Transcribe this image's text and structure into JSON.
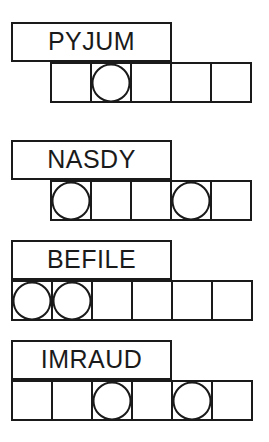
{
  "puzzle": {
    "type": "word-grid-puzzle",
    "background_color": "#ffffff",
    "line_color": "#1a1a1a",
    "groups": [
      {
        "id": "group-1",
        "word": "PYJUM",
        "label_box": {
          "x": 11,
          "y": 22,
          "width": 161,
          "height": 40
        },
        "grid": {
          "x": 50,
          "y": 62,
          "cell_width": 42,
          "cell_height": 41,
          "cells": 5
        },
        "circle_cells": [
          2
        ]
      },
      {
        "id": "group-2",
        "word": "NASDY",
        "label_box": {
          "x": 11,
          "y": 140,
          "width": 161,
          "height": 40
        },
        "grid": {
          "x": 50,
          "y": 180,
          "cell_width": 42,
          "cell_height": 41,
          "cells": 5
        },
        "circle_cells": [
          1,
          4
        ]
      },
      {
        "id": "group-3",
        "word": "BEFILE",
        "label_box": {
          "x": 11,
          "y": 240,
          "width": 161,
          "height": 40
        },
        "grid": {
          "x": 11,
          "y": 280,
          "cell_width": 42,
          "cell_height": 41,
          "cells": 6
        },
        "circle_cells": [
          1,
          2
        ]
      },
      {
        "id": "group-4",
        "word": "IMRAUD",
        "label_box": {
          "x": 11,
          "y": 340,
          "width": 161,
          "height": 40
        },
        "grid": {
          "x": 11,
          "y": 380,
          "cell_width": 42,
          "cell_height": 41,
          "cells": 6
        },
        "circle_cells": [
          3,
          5
        ]
      }
    ]
  }
}
